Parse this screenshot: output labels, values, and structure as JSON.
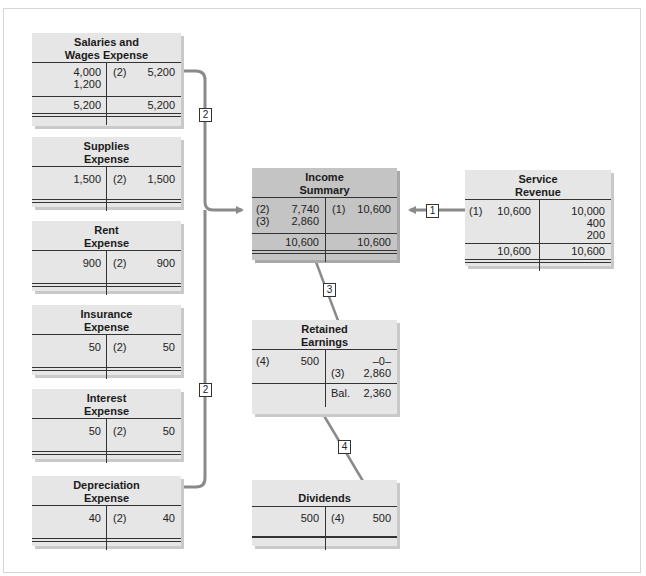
{
  "header": {
    "cut_off_text": ""
  },
  "accounts": {
    "salaries": {
      "title_line1": "Salaries and",
      "title_line2": "Wages Expense",
      "debits": [
        "4,000",
        "1,200"
      ],
      "credit_tag": "(2)",
      "credit": "5,200",
      "total_debit": "5,200",
      "total_credit": "5,200"
    },
    "supplies": {
      "title_line1": "Supplies",
      "title_line2": "Expense",
      "debit": "1,500",
      "credit_tag": "(2)",
      "credit": "1,500"
    },
    "rent": {
      "title_line1": "Rent",
      "title_line2": "Expense",
      "debit": "900",
      "credit_tag": "(2)",
      "credit": "900"
    },
    "insurance": {
      "title_line1": "Insurance",
      "title_line2": "Expense",
      "debit": "50",
      "credit_tag": "(2)",
      "credit": "50"
    },
    "interest": {
      "title_line1": "Interest",
      "title_line2": "Expense",
      "debit": "50",
      "credit_tag": "(2)",
      "credit": "50"
    },
    "depreciation": {
      "title_line1": "Depreciation",
      "title_line2": "Expense",
      "debit": "40",
      "credit_tag": "(2)",
      "credit": "40"
    },
    "income_summary": {
      "title_line1": "Income",
      "title_line2": "Summary",
      "debits": [
        {
          "tag": "(2)",
          "value": "7,740"
        },
        {
          "tag": "(3)",
          "value": "2,860"
        }
      ],
      "credit_tag": "(1)",
      "credit": "10,600",
      "total_debit": "10,600",
      "total_credit": "10,600"
    },
    "service_revenue": {
      "title_line1": "Service",
      "title_line2": "Revenue",
      "debit_tag": "(1)",
      "debit": "10,600",
      "credits": [
        "10,000",
        "400",
        "200"
      ],
      "total_debit": "10,600",
      "total_credit": "10,600"
    },
    "retained_earnings": {
      "title_line1": "Retained",
      "title_line2": "Earnings",
      "debit_tag": "(4)",
      "debit": "500",
      "credit_open": "–0–",
      "credit_tag": "(3)",
      "credit": "2,860",
      "bal_tag": "Bal.",
      "bal": "2,360"
    },
    "dividends": {
      "title": "Dividends",
      "debit": "500",
      "credit_tag": "(4)",
      "credit": "500"
    }
  },
  "step_labels": {
    "s1": "1",
    "s2a": "2",
    "s2b": "2",
    "s3": "3",
    "s4": "4"
  },
  "colors": {
    "box": "#e6e6e6",
    "box_dark": "#c4c4c4",
    "arrow": "#8a8a8a",
    "rule": "#333333"
  }
}
